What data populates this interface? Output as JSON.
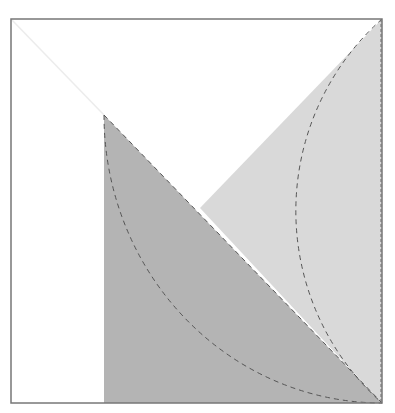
{
  "diagram": {
    "type": "geometric-figure",
    "colors": {
      "background": "#ffffff",
      "frame_stroke": "#777777",
      "dark_region": "#b4b4b4",
      "light_region": "#d9d9d9",
      "dashed_stroke": "#555555",
      "faint_diagonal": "#ececec"
    },
    "frame": {
      "x": 11,
      "y": 19,
      "width": 371,
      "height": 384
    },
    "points": {
      "top_left": [
        11,
        19
      ],
      "top_right": [
        382,
        19
      ],
      "bottom_right": [
        382,
        403
      ],
      "bottom_left": [
        11,
        403
      ],
      "apex": [
        104,
        115
      ],
      "dark_bottom_left": [
        104,
        403
      ],
      "intersection": [
        200,
        208
      ]
    },
    "regions": [
      {
        "name": "dark-region",
        "polygon": [
          [
            104,
            115
          ],
          [
            382,
            403
          ],
          [
            104,
            403
          ]
        ],
        "fill": "#b4b4b4"
      },
      {
        "name": "light-region",
        "polygon": [
          [
            382,
            19
          ],
          [
            382,
            403
          ],
          [
            200,
            208
          ]
        ],
        "fill": "#d9d9d9"
      }
    ],
    "arcs": [
      {
        "name": "left-arc",
        "from": [
          104,
          115
        ],
        "to": [
          382,
          403
        ],
        "rx": 278,
        "ry": 288,
        "dashed": true
      },
      {
        "name": "right-arc",
        "from": [
          382,
          19
        ],
        "to": [
          382,
          403
        ],
        "r": 257,
        "dashed": true
      }
    ],
    "lines": [
      {
        "name": "faint-diagonal",
        "from": [
          11,
          19
        ],
        "to": [
          104,
          115
        ]
      },
      {
        "name": "dark-hypotenuse",
        "from": [
          104,
          115
        ],
        "to": [
          382,
          403
        ],
        "dashed": true
      },
      {
        "name": "right-edge-dashed",
        "from": [
          382,
          19
        ],
        "to": [
          382,
          403
        ],
        "dashed": true
      }
    ]
  }
}
